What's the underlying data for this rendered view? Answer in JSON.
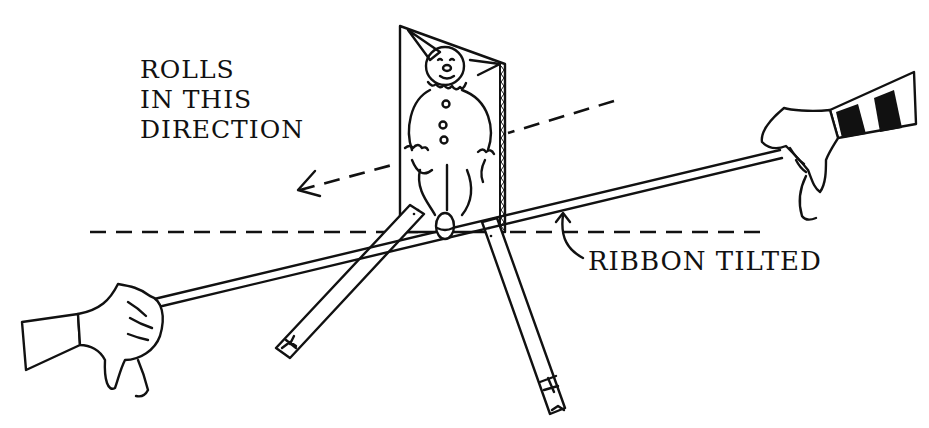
{
  "illustration": {
    "type": "line drawing",
    "subject": "Clown tumbler toy rolling on a tilted ribbon held between two hands",
    "colors": {
      "ink": "#111111",
      "paper": "#ffffff"
    }
  },
  "labels": {
    "direction": {
      "lines": [
        "ROLLS",
        "IN THIS",
        "DIRECTION"
      ]
    },
    "ribbon": {
      "text": "RIBBON TILTED"
    }
  },
  "elements": {
    "left_hand": "hand-holding-ribbon-left",
    "right_hand": "hand-holding-ribbon-right-striped-sleeve",
    "toy": "clown-card-figure",
    "legs": [
      "left-stick-leg",
      "right-stick-leg"
    ],
    "guides": [
      "horizontal-dashed-reference-line",
      "dashed-direction-arrow"
    ]
  }
}
